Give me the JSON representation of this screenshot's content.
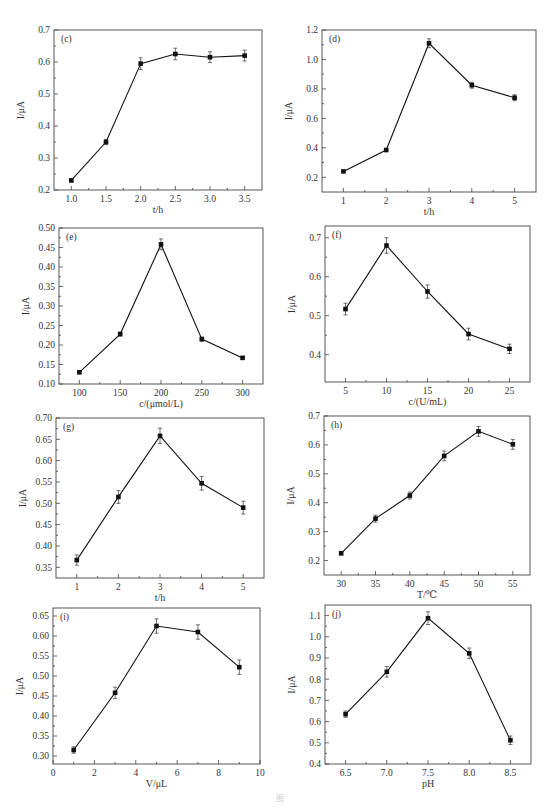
{
  "figure_caption": "图",
  "chart_data": [
    {
      "panel": "(c)",
      "type": "line",
      "xlabel": "t/h",
      "ylabel": "I/μA",
      "x": [
        1.0,
        1.5,
        2.0,
        2.5,
        3.0,
        3.5
      ],
      "values": [
        0.23,
        0.35,
        0.595,
        0.625,
        0.615,
        0.62
      ],
      "errors": [
        0.005,
        0.008,
        0.018,
        0.018,
        0.017,
        0.017
      ],
      "xlim": [
        0.75,
        3.75
      ],
      "ylim": [
        0.2,
        0.7
      ],
      "xticks": [
        1.0,
        1.5,
        2.0,
        2.5,
        3.0,
        3.5
      ],
      "xtick_labels": [
        "1.0",
        "1.5",
        "2.0",
        "2.5",
        "3.0",
        "3.5"
      ],
      "yticks": [
        0.2,
        0.3,
        0.4,
        0.5,
        0.6,
        0.7
      ],
      "ytick_labels": [
        "0.2",
        "0.3",
        "0.4",
        "0.5",
        "0.6",
        "0.7"
      ],
      "frame": {
        "x0": 54,
        "y0": 30,
        "x1": 262,
        "y1": 190
      },
      "grid": false
    },
    {
      "panel": "(d)",
      "type": "line",
      "xlabel": "t/h",
      "ylabel": "I/μA",
      "x": [
        1,
        2,
        3,
        4,
        5
      ],
      "values": [
        0.24,
        0.385,
        1.11,
        0.825,
        0.74
      ],
      "errors": [
        0.005,
        0.008,
        0.03,
        0.02,
        0.02
      ],
      "xlim": [
        0.5,
        5.5
      ],
      "ylim": [
        0.1,
        1.2
      ],
      "xticks": [
        1,
        2,
        3,
        4,
        5
      ],
      "xtick_labels": [
        "1",
        "2",
        "3",
        "4",
        "5"
      ],
      "yticks": [
        0.2,
        0.4,
        0.6,
        0.8,
        1.0,
        1.2
      ],
      "ytick_labels": [
        "0.2",
        "0.4",
        "0.6",
        "0.8",
        "1.0",
        "1.2"
      ],
      "frame": {
        "x0": 322,
        "y0": 30,
        "x1": 536,
        "y1": 192
      },
      "grid": false
    },
    {
      "panel": "(e)",
      "type": "line",
      "xlabel": "c/(μmol/L)",
      "ylabel": "I/μA",
      "x": [
        100,
        150,
        200,
        250,
        300
      ],
      "values": [
        0.13,
        0.228,
        0.458,
        0.215,
        0.167
      ],
      "errors": [
        0.003,
        0.005,
        0.014,
        0.005,
        0.003
      ],
      "xlim": [
        75,
        325
      ],
      "ylim": [
        0.1,
        0.5
      ],
      "xticks": [
        100,
        150,
        200,
        250,
        300
      ],
      "xtick_labels": [
        "100",
        "150",
        "200",
        "250",
        "300"
      ],
      "yticks": [
        0.1,
        0.15,
        0.2,
        0.25,
        0.3,
        0.35,
        0.4,
        0.45,
        0.5
      ],
      "ytick_labels": [
        "0.10",
        "0.15",
        "0.20",
        "0.25",
        "0.30",
        "0.35",
        "0.40",
        "0.45",
        "0.50"
      ],
      "frame": {
        "x0": 59,
        "y0": 228,
        "x1": 263,
        "y1": 384
      },
      "grid": false
    },
    {
      "panel": "(f)",
      "type": "line",
      "xlabel": "c/(U/mL)",
      "ylabel": "I/μA",
      "x": [
        5,
        10,
        15,
        20,
        25
      ],
      "values": [
        0.517,
        0.68,
        0.562,
        0.453,
        0.415
      ],
      "errors": [
        0.015,
        0.02,
        0.017,
        0.015,
        0.012
      ],
      "xlim": [
        2.5,
        27.5
      ],
      "ylim": [
        0.33,
        0.73
      ],
      "xticks": [
        5,
        10,
        15,
        20,
        25
      ],
      "xtick_labels": [
        "5",
        "10",
        "15",
        "20",
        "25"
      ],
      "yticks": [
        0.4,
        0.5,
        0.6,
        0.7
      ],
      "ytick_labels": [
        "0.4",
        "0.5",
        "0.6",
        "0.7"
      ],
      "frame": {
        "x0": 325,
        "y0": 226,
        "x1": 530,
        "y1": 382
      },
      "grid": false
    },
    {
      "panel": "(g)",
      "type": "line",
      "xlabel": "t/h",
      "ylabel": "I/μA",
      "x": [
        1,
        2,
        3,
        4,
        5
      ],
      "values": [
        0.367,
        0.515,
        0.658,
        0.547,
        0.49
      ],
      "errors": [
        0.012,
        0.015,
        0.018,
        0.016,
        0.015
      ],
      "xlim": [
        0.5,
        5.5
      ],
      "ylim": [
        0.325,
        0.7
      ],
      "xticks": [
        1,
        2,
        3,
        4,
        5
      ],
      "xtick_labels": [
        "1",
        "2",
        "3",
        "4",
        "5"
      ],
      "yticks": [
        0.35,
        0.4,
        0.45,
        0.5,
        0.55,
        0.6,
        0.65,
        0.7
      ],
      "ytick_labels": [
        "0.35",
        "0.40",
        "0.45",
        "0.50",
        "0.55",
        "0.60",
        "0.65",
        "0.70"
      ],
      "frame": {
        "x0": 56,
        "y0": 418,
        "x1": 264,
        "y1": 578
      },
      "grid": false
    },
    {
      "panel": "(h)",
      "type": "line",
      "xlabel": "T/℃",
      "ylabel": "I/μA",
      "x": [
        30,
        35,
        40,
        45,
        50,
        55
      ],
      "values": [
        0.225,
        0.345,
        0.425,
        0.562,
        0.647,
        0.602
      ],
      "errors": [
        0.005,
        0.012,
        0.012,
        0.017,
        0.017,
        0.017
      ],
      "xlim": [
        27.5,
        57.5
      ],
      "ylim": [
        0.15,
        0.7
      ],
      "xticks": [
        30,
        35,
        40,
        45,
        50,
        55
      ],
      "xtick_labels": [
        "30",
        "35",
        "40",
        "45",
        "50",
        "55"
      ],
      "yticks": [
        0.2,
        0.3,
        0.4,
        0.5,
        0.6,
        0.7
      ],
      "ytick_labels": [
        "0.2",
        "0.3",
        "0.4",
        "0.5",
        "0.6",
        "0.7"
      ],
      "frame": {
        "x0": 324,
        "y0": 416,
        "x1": 530,
        "y1": 575
      },
      "grid": false
    },
    {
      "panel": "(i)",
      "type": "line",
      "xlabel": "V/μL",
      "ylabel": "I/μA",
      "x": [
        1,
        3,
        5,
        7,
        9
      ],
      "values": [
        0.315,
        0.458,
        0.625,
        0.61,
        0.522
      ],
      "errors": [
        0.008,
        0.014,
        0.018,
        0.018,
        0.018
      ],
      "xlim": [
        0,
        10
      ],
      "ylim": [
        0.28,
        0.67
      ],
      "xticks": [
        0,
        2,
        4,
        6,
        8,
        10
      ],
      "xtick_labels": [
        "0",
        "2",
        "4",
        "6",
        "8",
        "10"
      ],
      "yticks": [
        0.3,
        0.35,
        0.4,
        0.45,
        0.5,
        0.55,
        0.6,
        0.65
      ],
      "ytick_labels": [
        "0.30",
        "0.35",
        "0.40",
        "0.45",
        "0.50",
        "0.55",
        "0.60",
        "0.65"
      ],
      "frame": {
        "x0": 53,
        "y0": 608,
        "x1": 260,
        "y1": 764
      },
      "grid": false
    },
    {
      "panel": "(j)",
      "type": "line",
      "xlabel": "pH",
      "ylabel": "I/μA",
      "x": [
        6.5,
        7.0,
        7.5,
        8.0,
        8.5
      ],
      "values": [
        0.635,
        0.835,
        1.088,
        0.922,
        0.512
      ],
      "errors": [
        0.015,
        0.025,
        0.03,
        0.025,
        0.02
      ],
      "xlim": [
        6.25,
        8.75
      ],
      "ylim": [
        0.4,
        1.15
      ],
      "xticks": [
        6.5,
        7.0,
        7.5,
        8.0,
        8.5
      ],
      "xtick_labels": [
        "6.5",
        "7.0",
        "7.5",
        "8.0",
        "8.5"
      ],
      "yticks": [
        0.4,
        0.5,
        0.6,
        0.7,
        0.8,
        0.9,
        1.0,
        1.1
      ],
      "ytick_labels": [
        "0.4",
        "0.5",
        "0.6",
        "0.7",
        "0.8",
        "0.9",
        "1.0",
        "1.1"
      ],
      "frame": {
        "x0": 325,
        "y0": 605,
        "x1": 531,
        "y1": 764
      },
      "grid": false
    }
  ]
}
